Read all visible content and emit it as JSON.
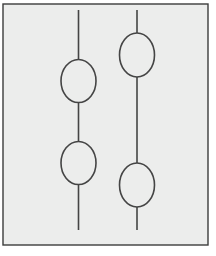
{
  "figure": {
    "canvas": {
      "width": 216,
      "height": 256,
      "background_color": "#ffffff"
    },
    "panel": {
      "label": "Drawing panel",
      "x": 3,
      "y": 4,
      "width": 205,
      "height": 241,
      "fill_color": "#ecedec",
      "border_color": "#3c3c3c",
      "border_width": 1.4
    },
    "stroke": {
      "color": "#454545",
      "width": 1.6,
      "fill": "none"
    },
    "strands": [
      {
        "name": "left-strand",
        "label": "Left strand",
        "line": {
          "x": 78.5,
          "y_top": 10,
          "y_bottom": 230
        },
        "ellipses": [
          {
            "name": "left-ellipse-upper",
            "label": "Left upper ellipse",
            "cx": 78.5,
            "cy": 81,
            "rx": 17.5,
            "ry": 21.5
          },
          {
            "name": "left-ellipse-lower",
            "label": "Left lower ellipse",
            "cx": 78.5,
            "cy": 163,
            "rx": 17.5,
            "ry": 21.5
          }
        ]
      },
      {
        "name": "right-strand",
        "label": "Right strand",
        "line": {
          "x": 137,
          "y_top": 10,
          "y_bottom": 230
        },
        "ellipses": [
          {
            "name": "right-ellipse-upper",
            "label": "Right upper ellipse",
            "cx": 137,
            "cy": 55,
            "rx": 17.5,
            "ry": 22
          },
          {
            "name": "right-ellipse-lower",
            "label": "Right lower ellipse",
            "cx": 137,
            "cy": 185,
            "rx": 17.5,
            "ry": 22
          }
        ]
      }
    ]
  }
}
